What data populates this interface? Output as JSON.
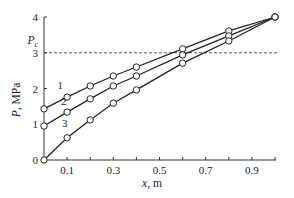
{
  "chart_data": {
    "type": "line",
    "title": "",
    "xlabel": "x, m",
    "ylabel": "P, MPa",
    "xlim": [
      0,
      1.0
    ],
    "ylim": [
      0,
      4
    ],
    "x_tick_labels": [
      "0.1",
      "0.3",
      "0.5",
      "0.7",
      "0.9"
    ],
    "x_ticks": [
      0.1,
      0.2,
      0.3,
      0.4,
      0.5,
      0.6,
      0.7,
      0.8,
      0.9,
      1.0
    ],
    "y_tick_labels": [
      "0",
      "1",
      "2",
      "3",
      "4"
    ],
    "y_ticks": [
      0,
      1,
      2,
      3,
      4
    ],
    "grid": false,
    "legend": "inline curve labels",
    "reference_line": {
      "label": "P_c",
      "label_main": "P",
      "label_sub": "c",
      "value": 3,
      "style": "dashed"
    },
    "x": [
      0,
      0.1,
      0.2,
      0.3,
      0.4,
      0.6,
      0.8,
      1.0
    ],
    "series": [
      {
        "name": "1",
        "values": [
          1.43,
          1.76,
          2.07,
          2.35,
          2.6,
          3.11,
          3.61,
          4.0
        ],
        "label_pos": [
          0.07,
          2.0
        ]
      },
      {
        "name": "2",
        "values": [
          0.95,
          1.34,
          1.71,
          2.07,
          2.35,
          2.94,
          3.47,
          4.0
        ],
        "label_pos": [
          0.085,
          1.55
        ]
      },
      {
        "name": "3",
        "values": [
          0.0,
          0.62,
          1.12,
          1.59,
          1.96,
          2.71,
          3.33,
          4.0
        ],
        "label_pos": [
          0.09,
          0.93
        ]
      }
    ],
    "marker": "open-circle"
  }
}
